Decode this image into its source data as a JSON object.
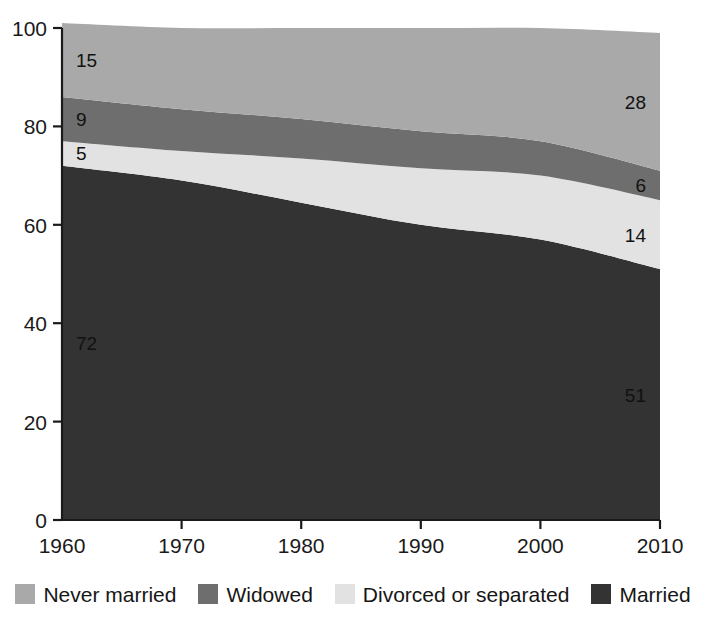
{
  "chart_data": {
    "type": "area",
    "title": "",
    "subtitle": "",
    "xlabel": "",
    "ylabel": "",
    "stacked": true,
    "grid": false,
    "legend_position": "bottom",
    "x": [
      1960,
      1970,
      1980,
      1990,
      2000,
      2010
    ],
    "xtick_labels": [
      "1960",
      "1970",
      "1980",
      "1990",
      "2000",
      "2010"
    ],
    "ytick_labels": [
      "0",
      "20",
      "40",
      "60",
      "80",
      "100"
    ],
    "ytick_values": [
      0,
      20,
      40,
      60,
      80,
      100
    ],
    "xlim": [
      1960,
      2010
    ],
    "ylim": [
      0,
      100
    ],
    "series": [
      {
        "name": "Married",
        "color": "#333333",
        "values": [
          72,
          69,
          64.5,
          60,
          57,
          51
        ],
        "stack_order": 1,
        "labels": [
          {
            "x": 1960,
            "text": "72"
          },
          {
            "x": 2010,
            "text": "51"
          }
        ]
      },
      {
        "name": "Divorced or separated",
        "color": "#e2e2e2",
        "values": [
          5,
          6,
          9,
          11.5,
          13,
          14
        ],
        "stack_order": 2,
        "labels": [
          {
            "x": 1960,
            "text": "5"
          },
          {
            "x": 2010,
            "text": "14"
          }
        ]
      },
      {
        "name": "Widowed",
        "color": "#6e6e6e",
        "values": [
          9,
          8.5,
          8,
          7.5,
          7,
          6
        ],
        "stack_order": 3,
        "labels": [
          {
            "x": 1960,
            "text": "9"
          },
          {
            "x": 2010,
            "text": "6"
          }
        ]
      },
      {
        "name": "Never married",
        "color": "#a9a9a9",
        "values": [
          15,
          16.5,
          18.5,
          21,
          23,
          28
        ],
        "stack_order": 4,
        "labels": [
          {
            "x": 1960,
            "text": "15"
          },
          {
            "x": 2010,
            "text": "28"
          }
        ]
      }
    ],
    "annotations": [
      {
        "series": "Never married",
        "year": 1960,
        "value": "15"
      },
      {
        "series": "Widowed",
        "year": 1960,
        "value": "9"
      },
      {
        "series": "Divorced or separated",
        "year": 1960,
        "value": "5"
      },
      {
        "series": "Married",
        "year": 1960,
        "value": "72"
      },
      {
        "series": "Never married",
        "year": 2010,
        "value": "28"
      },
      {
        "series": "Widowed",
        "year": 2010,
        "value": "6"
      },
      {
        "series": "Divorced or separated",
        "year": 2010,
        "value": "14"
      },
      {
        "series": "Married",
        "year": 2010,
        "value": "51"
      }
    ]
  },
  "legend": {
    "items": [
      {
        "label": "Never married",
        "color": "#a9a9a9"
      },
      {
        "label": "Widowed",
        "color": "#6e6e6e"
      },
      {
        "label": "Divorced or separated",
        "color": "#e2e2e2"
      },
      {
        "label": "Married",
        "color": "#333333"
      }
    ]
  },
  "axes": {
    "y_labels": [
      "100",
      "80",
      "60",
      "40",
      "20",
      "0"
    ],
    "x_labels": [
      "1960",
      "1970",
      "1980",
      "1990",
      "2000",
      "2010"
    ]
  }
}
